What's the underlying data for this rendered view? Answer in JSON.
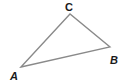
{
  "diagram": {
    "type": "triangle",
    "stroke_color": "#8a8a8a",
    "label_color": "#1a1a1a",
    "vertices": [
      {
        "name": "A",
        "x": 21,
        "y": 67,
        "label_x": 10,
        "label_y": 80
      },
      {
        "name": "B",
        "x": 110,
        "y": 47,
        "label_x": 110,
        "label_y": 64
      },
      {
        "name": "C",
        "x": 70,
        "y": 14,
        "label_x": 65,
        "label_y": 11
      }
    ],
    "labels": {
      "a": "A",
      "b": "B",
      "c": "C"
    }
  }
}
